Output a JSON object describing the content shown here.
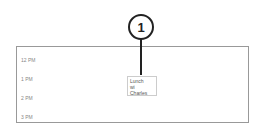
{
  "callout": {
    "number": "1"
  },
  "calendar": {
    "time_slots": [
      "12 PM",
      "1 PM",
      "2 PM",
      "3 PM"
    ],
    "event": {
      "lines": [
        "Lunch",
        "wi",
        "Charles"
      ]
    }
  }
}
